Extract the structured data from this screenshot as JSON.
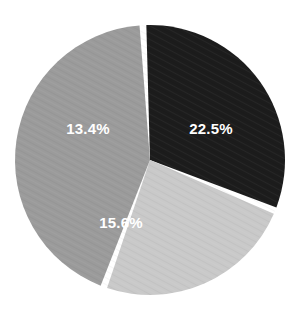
{
  "chart_data": {
    "type": "pie",
    "title": "",
    "subtitle": "",
    "xlabel": "",
    "ylabel": "",
    "legend": "none",
    "grid": false,
    "labels_shown": "percent",
    "background_color": "#ffffff",
    "separator_color": "#ffffff",
    "label_color": "#ffffff",
    "start_angle_deg": -3,
    "direction": "clockwise",
    "center": {
      "x": 150,
      "y": 160
    },
    "radius": 135,
    "categories": [
      "22.5%",
      "15.6%",
      "13.4%"
    ],
    "values": [
      22.5,
      15.6,
      13.4
    ],
    "slices": [
      {
        "label": "22.5%",
        "value": 22.5,
        "color": "#1c1c1c",
        "start_deg": -3,
        "end_deg": 112,
        "label_x": 211,
        "label_y": 130
      },
      {
        "label": "15.6%",
        "value": 15.6,
        "color": "#c9c9c9",
        "start_deg": 112,
        "end_deg": 200,
        "label_x": 121,
        "label_y": 224
      },
      {
        "label": "13.4%",
        "value": 13.4,
        "color": "#9b9b9b",
        "start_deg": 200,
        "end_deg": 357,
        "label_x": 88,
        "label_y": 130
      }
    ]
  },
  "chart": {
    "slice_1_label": "22.5%",
    "slice_2_label": "15.6%",
    "slice_3_label": "13.4%"
  }
}
